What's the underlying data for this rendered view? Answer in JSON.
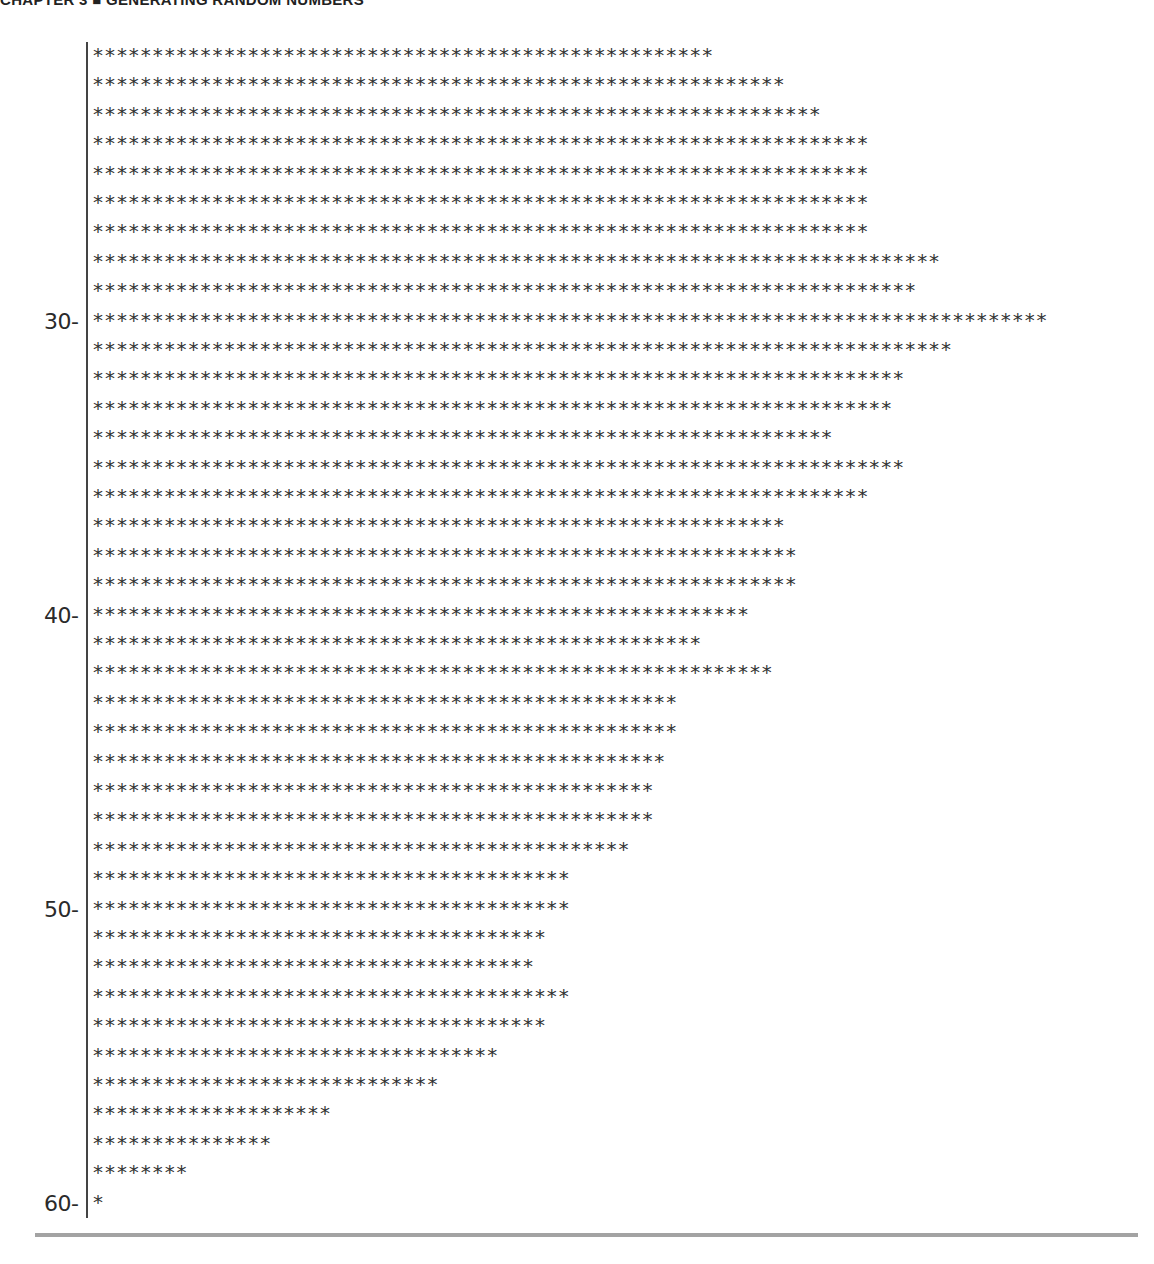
{
  "header": {
    "running_head": "CHAPTER 3 ■ GENERATING RANDOM NUMBERS"
  },
  "chart_data": {
    "type": "bar",
    "orientation": "horizontal",
    "title": "",
    "xlabel": "count (asterisks)",
    "ylabel": "value",
    "bar_glyph": "*",
    "tick_labels": [
      "30-",
      "40-",
      "50-",
      "60-"
    ],
    "categories": [
      21,
      22,
      23,
      24,
      25,
      26,
      27,
      28,
      29,
      30,
      31,
      32,
      33,
      34,
      35,
      36,
      37,
      38,
      39,
      40,
      41,
      42,
      43,
      44,
      45,
      46,
      47,
      48,
      49,
      50,
      51,
      52,
      53,
      54,
      55,
      56,
      57,
      58,
      59,
      60
    ],
    "values": [
      52,
      58,
      61,
      65,
      65,
      65,
      65,
      71,
      69,
      80,
      72,
      68,
      67,
      62,
      68,
      65,
      58,
      59,
      59,
      55,
      51,
      57,
      49,
      49,
      48,
      47,
      47,
      45,
      40,
      40,
      38,
      37,
      40,
      38,
      34,
      29,
      20,
      15,
      8,
      1
    ]
  },
  "colors": {
    "text": "#2a2a2a",
    "rule": "#a3a3a3",
    "axis": "#444444"
  }
}
